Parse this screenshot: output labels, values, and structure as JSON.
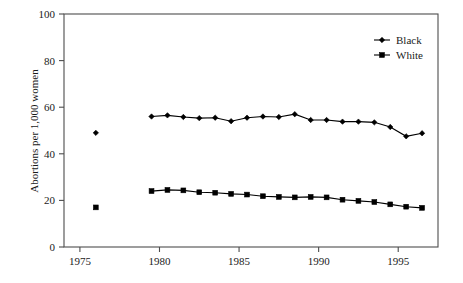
{
  "chart_data": {
    "type": "line",
    "title": "",
    "subtitle": "",
    "xlabel": "",
    "ylabel": "Abortions per 1,000 women",
    "xlim": [
      1974.0,
      1997.5
    ],
    "ylim": [
      0,
      100
    ],
    "grid": false,
    "legend_position": "top-right",
    "xticks": [
      1975,
      1980,
      1985,
      1990,
      1995
    ],
    "xtick_labels": [
      "1975",
      "1980",
      "1985",
      "1990",
      "1995"
    ],
    "yticks": [
      0,
      20,
      40,
      60,
      80,
      100
    ],
    "ytick_labels": [
      "0",
      "20",
      "40",
      "60",
      "80",
      "100"
    ],
    "series": [
      {
        "name": "Black",
        "marker": "diamond",
        "color": "#000000",
        "points": [
          {
            "x": 1976,
            "y": 49,
            "connected": false
          },
          {
            "x": 1979.5,
            "y": 56,
            "connected": true
          },
          {
            "x": 1980.5,
            "y": 56.5,
            "connected": true
          },
          {
            "x": 1981.5,
            "y": 55.8,
            "connected": true
          },
          {
            "x": 1982.5,
            "y": 55.3,
            "connected": true
          },
          {
            "x": 1983.5,
            "y": 55.5,
            "connected": true
          },
          {
            "x": 1984.5,
            "y": 54.0,
            "connected": true
          },
          {
            "x": 1985.5,
            "y": 55.5,
            "connected": true
          },
          {
            "x": 1986.5,
            "y": 56.0,
            "connected": true
          },
          {
            "x": 1987.5,
            "y": 55.8,
            "connected": true
          },
          {
            "x": 1988.5,
            "y": 57.0,
            "connected": true
          },
          {
            "x": 1989.5,
            "y": 54.5,
            "connected": true
          },
          {
            "x": 1990.5,
            "y": 54.5,
            "connected": true
          },
          {
            "x": 1991.5,
            "y": 53.8,
            "connected": true
          },
          {
            "x": 1992.5,
            "y": 53.8,
            "connected": true
          },
          {
            "x": 1993.5,
            "y": 53.5,
            "connected": true
          },
          {
            "x": 1994.5,
            "y": 51.5,
            "connected": true
          },
          {
            "x": 1995.5,
            "y": 47.5,
            "connected": true
          },
          {
            "x": 1996.5,
            "y": 48.8,
            "connected": true
          }
        ]
      },
      {
        "name": "White",
        "marker": "square",
        "color": "#000000",
        "points": [
          {
            "x": 1976,
            "y": 17,
            "connected": false
          },
          {
            "x": 1979.5,
            "y": 24.0,
            "connected": true
          },
          {
            "x": 1980.5,
            "y": 24.5,
            "connected": true
          },
          {
            "x": 1981.5,
            "y": 24.3,
            "connected": true
          },
          {
            "x": 1982.5,
            "y": 23.5,
            "connected": true
          },
          {
            "x": 1983.5,
            "y": 23.3,
            "connected": true
          },
          {
            "x": 1984.5,
            "y": 22.8,
            "connected": true
          },
          {
            "x": 1985.5,
            "y": 22.5,
            "connected": true
          },
          {
            "x": 1986.5,
            "y": 21.8,
            "connected": true
          },
          {
            "x": 1987.5,
            "y": 21.5,
            "connected": true
          },
          {
            "x": 1988.5,
            "y": 21.3,
            "connected": true
          },
          {
            "x": 1989.5,
            "y": 21.5,
            "connected": true
          },
          {
            "x": 1990.5,
            "y": 21.3,
            "connected": true
          },
          {
            "x": 1991.5,
            "y": 20.3,
            "connected": true
          },
          {
            "x": 1992.5,
            "y": 19.8,
            "connected": true
          },
          {
            "x": 1993.5,
            "y": 19.3,
            "connected": true
          },
          {
            "x": 1994.5,
            "y": 18.3,
            "connected": true
          },
          {
            "x": 1995.5,
            "y": 17.3,
            "connected": true
          },
          {
            "x": 1996.5,
            "y": 16.8,
            "connected": true
          }
        ]
      }
    ],
    "legend": [
      {
        "label": "Black",
        "marker": "diamond"
      },
      {
        "label": "White",
        "marker": "square"
      }
    ]
  }
}
